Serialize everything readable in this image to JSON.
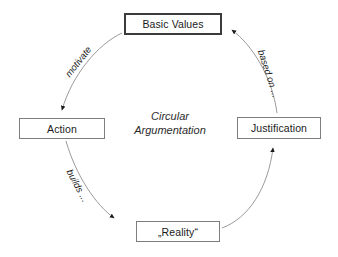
{
  "diagram": {
    "center_label_line1": "Circular",
    "center_label_line2": "Argumentation",
    "nodes": [
      {
        "id": "basic-values",
        "label": "Basic Values",
        "emphasis": true
      },
      {
        "id": "action",
        "label": "Action",
        "emphasis": false
      },
      {
        "id": "reality",
        "label": "„Reality“",
        "emphasis": false
      },
      {
        "id": "justification",
        "label": "Justification",
        "emphasis": false
      }
    ],
    "edges": [
      {
        "id": "motivate",
        "label": "motivate",
        "from": "basic-values",
        "to": "action"
      },
      {
        "id": "builds",
        "label": "builds ...",
        "from": "action",
        "to": "reality"
      },
      {
        "id": "based-on",
        "label": "based on ...",
        "from": "justification",
        "to": "basic-values"
      },
      {
        "id": "supports",
        "label": "",
        "from": "reality",
        "to": "justification"
      }
    ],
    "colors": {
      "background": "#ffffff",
      "box_border": "#7d7d7d",
      "box_border_emphasis": "#3c3c3c",
      "arc_stroke": "#9a9a9a",
      "arrow_fill": "#1a1a1a",
      "text": "#1a1a1a"
    }
  }
}
